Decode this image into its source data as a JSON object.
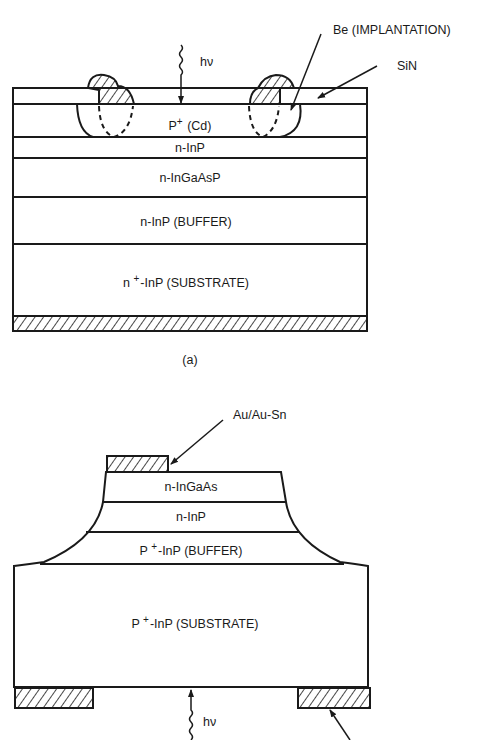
{
  "figure_a": {
    "caption": "(a)",
    "photon_label": "hν",
    "callouts": {
      "implantation": "Be (IMPLANTATION)",
      "passivation": "SiN"
    },
    "layers": [
      {
        "prefix": "P",
        "sup": "+",
        "suffix": " (Cd)"
      },
      {
        "prefix": "n-InP",
        "sup": "",
        "suffix": ""
      },
      {
        "prefix": "n-InGaAsP",
        "sup": "",
        "suffix": ""
      },
      {
        "prefix": "n-InP (BUFFER)",
        "sup": "",
        "suffix": ""
      },
      {
        "prefix": "n ",
        "sup": "+",
        "suffix": "-InP (SUBSTRATE)"
      }
    ]
  },
  "figure_b": {
    "photon_label": "hν",
    "callouts": {
      "contact": "Au/Au-Sn"
    },
    "layers": [
      {
        "prefix": "n-InGaAs",
        "sup": "",
        "suffix": ""
      },
      {
        "prefix": "n-InP",
        "sup": "",
        "suffix": ""
      },
      {
        "prefix": "P ",
        "sup": "+",
        "suffix": "-InP (BUFFER)"
      },
      {
        "prefix": "P ",
        "sup": "+",
        "suffix": "-InP (SUBSTRATE)"
      }
    ]
  },
  "colors": {
    "ink": "#1a1a1a",
    "background": "#ffffff"
  }
}
